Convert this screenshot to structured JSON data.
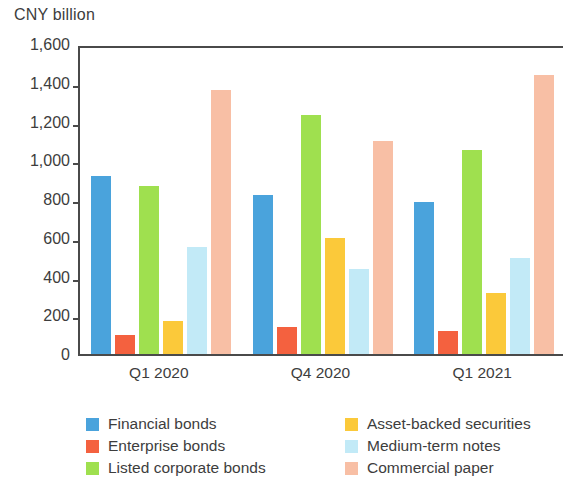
{
  "chart_data": {
    "type": "bar",
    "title": "",
    "subtitle": "",
    "xlabel": "",
    "ylabel": "CNY billion",
    "ylim": [
      0,
      1600
    ],
    "ytick_step": 200,
    "ytick_labels": [
      "1,600",
      "1,400",
      "1,200",
      "1,000",
      "800",
      "600",
      "400",
      "200",
      "0"
    ],
    "ytick_values": [
      1600,
      1400,
      1200,
      1000,
      800,
      600,
      400,
      200,
      0
    ],
    "grid": false,
    "legend_position": "bottom",
    "categories": [
      "Q1 2020",
      "Q4 2020",
      "Q1 2021"
    ],
    "series": [
      {
        "name": "Financial bonds",
        "color": "#4AA3DC",
        "values": [
          920,
          820,
          785
        ]
      },
      {
        "name": "Enterprise bonds",
        "color": "#F4613F",
        "values": [
          100,
          140,
          120
        ]
      },
      {
        "name": "Listed corporate bonds",
        "color": "#9FE04F",
        "values": [
          865,
          1235,
          1055
        ]
      },
      {
        "name": "Asset-backed securities",
        "color": "#FBC93A",
        "values": [
          170,
          600,
          315
        ]
      },
      {
        "name": "Medium-term notes",
        "color": "#C2EAF7",
        "values": [
          550,
          440,
          495
        ]
      },
      {
        "name": "Commercial paper",
        "color": "#F8BFA5",
        "values": [
          1365,
          1100,
          1440
        ]
      }
    ]
  },
  "axis": {
    "unit_label": "CNY billion"
  },
  "legend": {
    "left_column": [
      {
        "label": "Financial bonds",
        "color": "#4AA3DC"
      },
      {
        "label": "Enterprise bonds",
        "color": "#F4613F"
      },
      {
        "label": "Listed corporate bonds",
        "color": "#9FE04F"
      }
    ],
    "right_column": [
      {
        "label": "Asset-backed securities",
        "color": "#FBC93A"
      },
      {
        "label": "Medium-term notes",
        "color": "#C2EAF7"
      },
      {
        "label": "Commercial paper",
        "color": "#F8BFA5"
      }
    ]
  }
}
